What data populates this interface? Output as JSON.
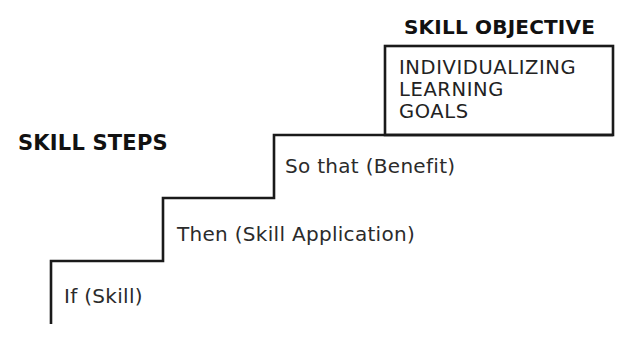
{
  "diagram": {
    "objective_heading": "SKILL OBJECTIVE",
    "steps_heading": "SKILL STEPS",
    "objective_box": {
      "lines": [
        "INDIVIDUALIZING",
        "LEARNING",
        "GOALS"
      ]
    },
    "steps": [
      {
        "label": "If (Skill)",
        "level": 1
      },
      {
        "label": "Then (Skill Application)",
        "level": 2
      },
      {
        "label": "So that (Benefit)",
        "level": 3
      }
    ],
    "bottom_cutoff_text": "",
    "colors": {
      "line": "#1a1a1a",
      "text": "#2b2b2b",
      "background": "#ffffff"
    }
  }
}
